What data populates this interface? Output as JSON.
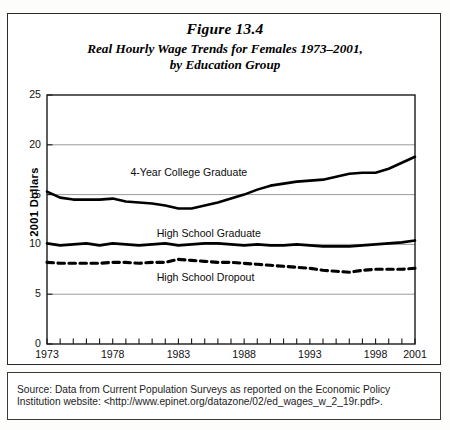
{
  "figure": {
    "number": "Figure 13.4"
  },
  "source": {
    "text": "Source: Data from Current Population Surveys as reported on the Economic Policy Institution website: <http://www.epinet.org/datazone/02/ed_wages_w_2_19r.pdf>."
  },
  "chart_data": {
    "type": "line",
    "xlabel": "",
    "ylabel": "2001 Dollars",
    "xlim": [
      1973,
      2001
    ],
    "ylim": [
      0,
      25
    ],
    "yticks": [
      0,
      5,
      10,
      15,
      20,
      25
    ],
    "xticks": [
      1973,
      1978,
      1983,
      1988,
      1993,
      1998,
      2001
    ],
    "xtick_all_years": [
      1973,
      1974,
      1975,
      1976,
      1977,
      1978,
      1979,
      1980,
      1981,
      1982,
      1983,
      1984,
      1985,
      1986,
      1987,
      1988,
      1989,
      1990,
      1991,
      1992,
      1993,
      1994,
      1995,
      1996,
      1997,
      1998,
      1999,
      2000,
      2001
    ],
    "grid": "horizontal",
    "legend_position": "inline-annotations",
    "x": [
      1973,
      1974,
      1975,
      1976,
      1977,
      1978,
      1979,
      1980,
      1981,
      1982,
      1983,
      1984,
      1985,
      1986,
      1987,
      1988,
      1989,
      1990,
      1991,
      1992,
      1993,
      1994,
      1995,
      1996,
      1997,
      1998,
      1999,
      2000,
      2001
    ],
    "series": [
      {
        "name": "4-Year College Graduate",
        "style": "solid",
        "color": "#000000",
        "label_x": 1983,
        "label_y": 17.2,
        "values": [
          15.3,
          14.7,
          14.5,
          14.5,
          14.5,
          14.6,
          14.3,
          14.2,
          14.1,
          13.9,
          13.6,
          13.6,
          13.9,
          14.2,
          14.6,
          15.0,
          15.5,
          15.9,
          16.1,
          16.3,
          16.4,
          16.5,
          16.8,
          17.1,
          17.2,
          17.2,
          17.6,
          18.2,
          18.8
        ]
      },
      {
        "name": "High School Graduate",
        "style": "solid",
        "color": "#000000",
        "label_x": 1985,
        "label_y": 11.0,
        "values": [
          10.1,
          9.9,
          10.0,
          10.1,
          9.9,
          10.1,
          10.0,
          9.9,
          10.0,
          10.1,
          9.9,
          10.0,
          10.1,
          10.1,
          10.0,
          9.9,
          10.0,
          9.9,
          9.9,
          10.0,
          9.9,
          9.8,
          9.8,
          9.8,
          9.9,
          10.0,
          10.1,
          10.2,
          10.4
        ]
      },
      {
        "name": "High School Dropout",
        "style": "dashed",
        "color": "#000000",
        "label_x": 1985,
        "label_y": 6.6,
        "values": [
          8.2,
          8.1,
          8.1,
          8.1,
          8.1,
          8.2,
          8.2,
          8.1,
          8.2,
          8.2,
          8.5,
          8.4,
          8.3,
          8.2,
          8.2,
          8.1,
          8.0,
          7.9,
          7.8,
          7.7,
          7.6,
          7.4,
          7.3,
          7.2,
          7.4,
          7.5,
          7.5,
          7.5,
          7.6
        ]
      }
    ]
  },
  "axis": {
    "y_label_text": "2001 Dollars"
  }
}
